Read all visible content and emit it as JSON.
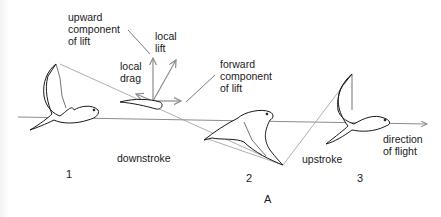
{
  "figure": {
    "panel_label": "A",
    "labels": {
      "upward_component": [
        "upward",
        "component",
        "of lift"
      ],
      "local_lift": [
        "local",
        "lift"
      ],
      "local_drag": [
        "local",
        "drag"
      ],
      "forward_component": [
        "forward",
        "component",
        "of lift"
      ],
      "downstroke": "downstroke",
      "upstroke": "upstroke",
      "direction_of_flight": [
        "direction",
        "of flight"
      ]
    },
    "positions": [
      "1",
      "2",
      "3"
    ],
    "colors": {
      "ink": "#1a1a1a",
      "guide_line": "#9a9a9a",
      "flight_axis": "#8c8c8c"
    }
  }
}
